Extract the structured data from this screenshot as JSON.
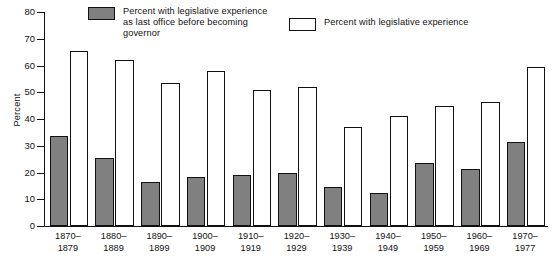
{
  "chart_data": {
    "type": "bar",
    "title": "",
    "xlabel": "",
    "ylabel": "Percent",
    "ylim": [
      0,
      80
    ],
    "yticks": [
      0,
      10,
      20,
      30,
      40,
      50,
      60,
      70,
      80
    ],
    "grid": false,
    "legend_position": "top",
    "categories": [
      "1870–\n1879",
      "1880–\n1889",
      "1890–\n1899",
      "1900–\n1909",
      "1910–\n1919",
      "1920–\n1929",
      "1930–\n1939",
      "1940–\n1949",
      "1950–\n1959",
      "1960–\n1969",
      "1970–\n1977"
    ],
    "series": [
      {
        "name": "Percent with legislative experience\nas last office before becoming\ngovernor",
        "short_name": "legislative-as-last-office",
        "style": "filled",
        "color": "#808080",
        "values": [
          33.5,
          25.5,
          16.5,
          18.5,
          19,
          20,
          14.5,
          12.5,
          23.5,
          21.5,
          31.5
        ]
      },
      {
        "name": "Percent with legislative experience",
        "short_name": "legislative-experience",
        "style": "hollow",
        "color": "#ffffff",
        "values": [
          65.5,
          62,
          53.5,
          58,
          51,
          52,
          37,
          41,
          45,
          46.5,
          59.5
        ]
      }
    ]
  },
  "colors": {
    "ink": "#111111",
    "fill_gray": "#808080",
    "fill_white": "#ffffff",
    "background": "#ffffff"
  }
}
